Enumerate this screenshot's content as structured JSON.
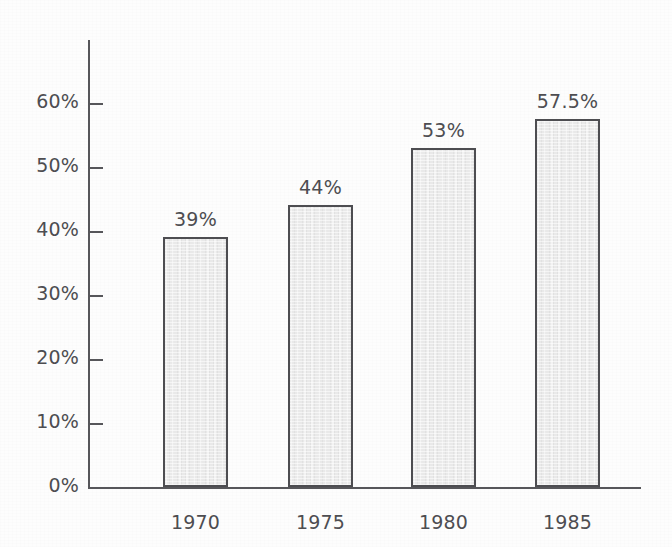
{
  "chart_data": {
    "type": "bar",
    "title": "",
    "subtitle": "",
    "xlabel": "",
    "ylabel": "",
    "categories": [
      "1970",
      "1975",
      "1980",
      "1985"
    ],
    "values": [
      39,
      44,
      53,
      57.5
    ],
    "value_labels": [
      "39%",
      "44%",
      "53%",
      "57.5%"
    ],
    "ylim": [
      0,
      65
    ],
    "y_ticks": [
      0,
      10,
      20,
      30,
      40,
      50,
      60
    ],
    "y_tick_labels": [
      "0%",
      "10%",
      "20%",
      "30%",
      "40%",
      "50%",
      "60%"
    ],
    "grid": false,
    "legend": null,
    "series": [
      {
        "name": "",
        "values": [
          39,
          44,
          53,
          57.5
        ]
      }
    ],
    "colors": {
      "bar_fill": "#e9e9e9",
      "bar_border": "#4d4d51",
      "axis": "#56565a",
      "text": "#4d4d51",
      "background": "#fdfdfd"
    }
  },
  "axis": {
    "y_ticks": [
      {
        "label": "60%",
        "value": 60
      },
      {
        "label": "50%",
        "value": 50
      },
      {
        "label": "40%",
        "value": 40
      },
      {
        "label": "30%",
        "value": 30
      },
      {
        "label": "20%",
        "value": 20
      },
      {
        "label": "10%",
        "value": 10
      },
      {
        "label": "0%",
        "value": 0
      }
    ]
  },
  "bars": [
    {
      "category": "1970",
      "value": 39,
      "value_label": "39%"
    },
    {
      "category": "1975",
      "value": 44,
      "value_label": "44%"
    },
    {
      "category": "1980",
      "value": 53,
      "value_label": "53%"
    },
    {
      "category": "1985",
      "value": 57.5,
      "value_label": "57.5%"
    }
  ]
}
